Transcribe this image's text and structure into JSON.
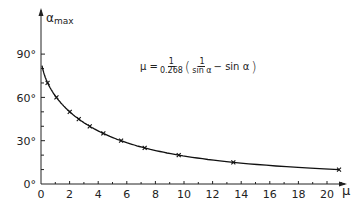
{
  "chart_data": {
    "type": "line",
    "title": "",
    "xlabel": "μ",
    "ylabel": "α_max",
    "xlim": [
      0,
      21
    ],
    "ylim": [
      0,
      95
    ],
    "x_ticks": [
      0,
      2,
      4,
      6,
      8,
      10,
      12,
      14,
      16,
      18,
      20
    ],
    "x_tick_labels": [
      "0",
      "2",
      "4",
      "6",
      "8",
      "10",
      "12",
      "14",
      "16",
      "18",
      "20"
    ],
    "y_ticks": [
      0,
      30,
      60,
      90
    ],
    "y_tick_labels": [
      "0°",
      "30°",
      "60°",
      "90°"
    ],
    "grid": false,
    "annotation": "μ = 1/0.268 (1/sin α − sin α)",
    "series": [
      {
        "name": "theoretical curve",
        "style": "solid line",
        "formula": "mu = (1/sin(alpha) - sin(alpha)) / 0.268"
      },
      {
        "name": "data points",
        "style": "x markers",
        "x": [
          0.46,
          1.08,
          2.01,
          2.64,
          3.41,
          4.36,
          5.6,
          7.25,
          9.63,
          13.45,
          20.84
        ],
        "y": [
          70,
          60,
          50,
          45,
          40,
          35,
          30,
          25,
          20,
          15,
          10
        ]
      }
    ]
  },
  "labels": {
    "y_axis": "α",
    "y_axis_sub": "max",
    "x_axis": "μ",
    "y_ticks": [
      "90°",
      "60°",
      "30°",
      "0°"
    ],
    "x_ticks": [
      "0",
      "2",
      "4",
      "6",
      "8",
      "10",
      "12",
      "14",
      "16",
      "18",
      "20"
    ],
    "formula": {
      "lhs": "μ =",
      "coef_num": "1",
      "coef_den": "0.268",
      "open": "(",
      "inner_num": "1",
      "inner_den": "sin α",
      "minus": "− sin α",
      "close": ")"
    }
  }
}
